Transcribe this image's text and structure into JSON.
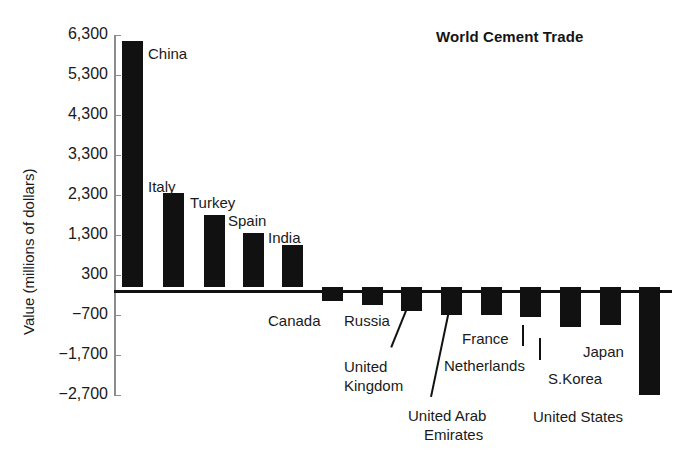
{
  "chart_data": {
    "type": "bar",
    "title": "World Cement Trade",
    "xlabel": "",
    "ylabel": "Value (millions of dollars)",
    "ylim": [
      -2700,
      6300
    ],
    "grid": false,
    "legend": "none",
    "ytick_labels": [
      "6,300",
      "5,300",
      "4,300",
      "3,300",
      "2,300",
      "1,300",
      "300",
      "−700",
      "−1,700",
      "−2,700"
    ],
    "ytick_values": [
      6300,
      5300,
      4300,
      3300,
      2300,
      1300,
      300,
      -700,
      -1700,
      -2700
    ],
    "categories": [
      "China",
      "Italy",
      "Turkey",
      "Spain",
      "India",
      "Canada",
      "Russia",
      "United Kingdom",
      "United Arab Emirates",
      "France",
      "Netherlands",
      "S.Korea",
      "Japan",
      "United States"
    ],
    "values": [
      6150,
      2350,
      1800,
      1350,
      1050,
      -350,
      -450,
      -600,
      -700,
      -700,
      -750,
      -1000,
      -950,
      -2700
    ]
  },
  "bars": [
    {
      "label": "China",
      "value": 6150,
      "x": 122,
      "width": 21
    },
    {
      "label": "Italy",
      "value": 2350,
      "x": 163,
      "width": 21
    },
    {
      "label": "Turkey",
      "value": 1800,
      "x": 204,
      "width": 21
    },
    {
      "label": "Spain",
      "value": 1350,
      "x": 243,
      "width": 21
    },
    {
      "label": "India",
      "value": 1050,
      "x": 282,
      "width": 21
    },
    {
      "label": "Canada",
      "value": -350,
      "x": 322,
      "width": 21
    },
    {
      "label": "Russia",
      "value": -450,
      "x": 362,
      "width": 21
    },
    {
      "label": "United Kingdom",
      "value": -600,
      "x": 401,
      "width": 21
    },
    {
      "label": "United Arab Emirates",
      "value": -700,
      "x": 441,
      "width": 21
    },
    {
      "label": "France",
      "value": -700,
      "x": 481,
      "width": 21
    },
    {
      "label": "Netherlands",
      "value": -750,
      "x": 520,
      "width": 21
    },
    {
      "label": "S.Korea",
      "value": -1000,
      "x": 560,
      "width": 21
    },
    {
      "label": "Japan",
      "value": -950,
      "x": 600,
      "width": 21
    },
    {
      "label": "United States",
      "value": -2700,
      "x": 639,
      "width": 21
    }
  ],
  "annotations": [
    {
      "name": "china",
      "text": "China",
      "x": 148,
      "y": 45
    },
    {
      "name": "italy",
      "text": "Italy",
      "x": 148,
      "y": 178
    },
    {
      "name": "turkey",
      "text": "Turkey",
      "x": 190,
      "y": 194
    },
    {
      "name": "spain",
      "text": "Spain",
      "x": 228,
      "y": 212
    },
    {
      "name": "india",
      "text": "India",
      "x": 268,
      "y": 229
    },
    {
      "name": "canada",
      "text": "Canada",
      "x": 268,
      "y": 312
    },
    {
      "name": "russia",
      "text": "Russia",
      "x": 344,
      "y": 312
    },
    {
      "name": "united-kingdom-line1",
      "text": "United",
      "x": 344,
      "y": 358
    },
    {
      "name": "united-kingdom-line2",
      "text": "Kingdom",
      "x": 344,
      "y": 377
    },
    {
      "name": "united-arab-emirates-line1",
      "text": "United Arab",
      "x": 408,
      "y": 407
    },
    {
      "name": "united-arab-emirates-line2",
      "text": "Emirates",
      "x": 424,
      "y": 426
    },
    {
      "name": "france",
      "text": "France",
      "x": 462,
      "y": 330
    },
    {
      "name": "netherlands",
      "text": "Netherlands",
      "x": 444,
      "y": 357
    },
    {
      "name": "s-korea",
      "text": "S.Korea",
      "x": 548,
      "y": 370
    },
    {
      "name": "japan",
      "text": "Japan",
      "x": 583,
      "y": 343
    },
    {
      "name": "united-states",
      "text": "United States",
      "x": 533,
      "y": 408
    }
  ],
  "leaders": [
    {
      "name": "united-kingdom-leader",
      "x1": 409,
      "y1": 306,
      "x2": 392,
      "y2": 348
    },
    {
      "name": "united-arab-emirates-leader",
      "x1": 451,
      "y1": 306,
      "x2": 432,
      "y2": 397
    },
    {
      "name": "netherlands-leader",
      "x1": 524,
      "y1": 325,
      "x2": 524,
      "y2": 346
    },
    {
      "name": "s-korea-leader",
      "x1": 541,
      "y1": 338,
      "x2": 541,
      "y2": 360
    }
  ],
  "title": {
    "text": "World Cement Trade",
    "x": 436,
    "y": 30
  }
}
